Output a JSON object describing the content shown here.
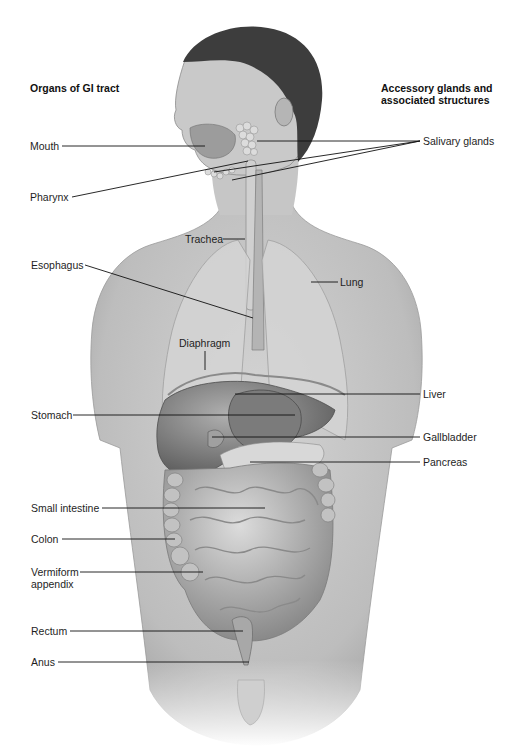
{
  "headings": {
    "left": "Organs of GI tract",
    "right_line1": "Accessory glands and",
    "right_line2": "associated structures"
  },
  "labels": {
    "mouth": "Mouth",
    "pharynx": "Pharynx",
    "salivary_glands": "Salivary glands",
    "trachea": "Trachea",
    "esophagus": "Esophagus",
    "lung": "Lung",
    "diaphragm": "Diaphragm",
    "liver": "Liver",
    "stomach": "Stomach",
    "gallbladder": "Gallbladder",
    "pancreas": "Pancreas",
    "small_intestine": "Small intestine",
    "colon": "Colon",
    "vermiform_appendix_line1": "Vermiform",
    "vermiform_appendix_line2": "appendix",
    "rectum": "Rectum",
    "anus": "Anus"
  },
  "colors": {
    "background": "#ffffff",
    "skin": "#c9c9c9",
    "skin_dark": "#a8a8a8",
    "hair": "#3a3a3a",
    "organ": "#8e8e8e",
    "organ_dark": "#5e5e5e",
    "lung": "#d6d6d6",
    "leader_line": "#111111"
  }
}
